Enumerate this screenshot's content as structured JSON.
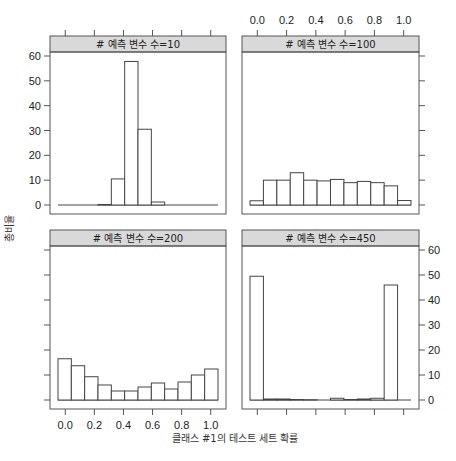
{
  "chart_data": {
    "type": "bar",
    "subtype": "histogram-trellis",
    "xlabel": "클래스 #1의 테스트 세트 확률",
    "ylabel": "총비율",
    "ylim": [
      0,
      60
    ],
    "xlim": [
      -0.05,
      1.05
    ],
    "x_ticks": [
      "0.0",
      "0.2",
      "0.4",
      "0.6",
      "0.8",
      "1.0"
    ],
    "y_ticks": [
      "0",
      "10",
      "20",
      "30",
      "40",
      "50",
      "60"
    ],
    "bin_edges": [
      -0.05,
      0.0417,
      0.1333,
      0.225,
      0.3167,
      0.4083,
      0.5,
      0.5917,
      0.6833,
      0.775,
      0.8667,
      0.9583,
      1.05
    ],
    "bar_fill": "#ffffff",
    "bar_stroke": "#444444",
    "strip_fill": "#d9d9d9",
    "panels": [
      {
        "title": "# 예측 변수 수=10",
        "values": [
          0,
          0,
          0,
          0.2,
          10.5,
          57.8,
          30.5,
          1.2,
          0,
          0,
          0,
          0
        ]
      },
      {
        "title": "# 예측 변수 수=100",
        "values": [
          1.7,
          10,
          10,
          13,
          10,
          9.7,
          10.3,
          9,
          9.5,
          9,
          7.7,
          1.8
        ]
      },
      {
        "title": "# 예측 변수 수=200",
        "values": [
          16.5,
          13.7,
          9.3,
          6,
          3.6,
          3.6,
          5.2,
          6.8,
          4.4,
          7.2,
          10,
          12.4
        ]
      },
      {
        "title": "# 예측 변수 수=450",
        "values": [
          49.5,
          0.4,
          0.4,
          0.2,
          0.1,
          0,
          0.7,
          0.2,
          0.4,
          0.7,
          46,
          0
        ]
      }
    ],
    "layout": {
      "rows": 2,
      "cols": 2,
      "order": "top-left, top-right, bottom-left, bottom-right",
      "grid": false
    }
  }
}
